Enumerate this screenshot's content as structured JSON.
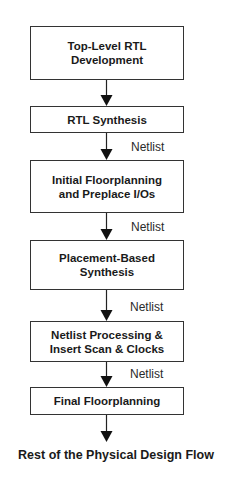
{
  "diagram": {
    "type": "flowchart",
    "steps": [
      {
        "label": "Top-Level RTL\nDevelopment"
      },
      {
        "label": "RTL Synthesis"
      },
      {
        "label": "Initial Floorplanning\nand Preplace I/Os"
      },
      {
        "label": "Placement-Based\nSynthesis"
      },
      {
        "label": "Netlist Processing &\nInsert Scan & Clocks"
      },
      {
        "label": "Final Floorplanning"
      }
    ],
    "edges": [
      {
        "from": 0,
        "to": 1,
        "label": ""
      },
      {
        "from": 1,
        "to": 2,
        "label": "Netlist"
      },
      {
        "from": 2,
        "to": 3,
        "label": "Netlist"
      },
      {
        "from": 3,
        "to": 4,
        "label": "Netlist"
      },
      {
        "from": 4,
        "to": 5,
        "label": "Netlist"
      },
      {
        "from": 5,
        "to": "end",
        "label": ""
      }
    ],
    "end_label": "Rest of the Physical Design Flow",
    "colors": {
      "stroke": "#333333",
      "text": "#1a1a1a",
      "background": "#ffffff"
    }
  }
}
